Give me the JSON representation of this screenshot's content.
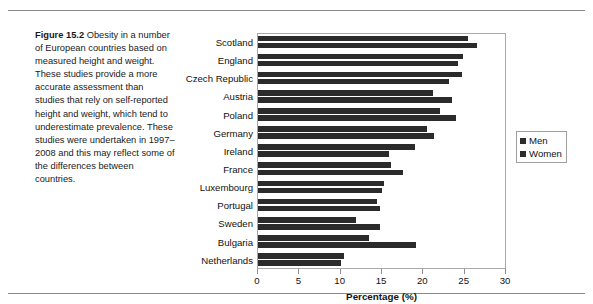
{
  "figure": {
    "label": "Figure 15.2",
    "caption": "Obesity in a number of European countries based on measured height and weight. These studies provide a more accurate assessment than studies that rely on self-reported height and weight, which tend to underestimate prevalence. These studies were undertaken in 1997–2008 and this may reflect some of the differences between countries."
  },
  "legend": {
    "position": "right",
    "items": [
      {
        "label": "Men",
        "color": "#2b2b2b"
      },
      {
        "label": "Women",
        "color": "#2b2b2b"
      }
    ]
  },
  "chart_data": {
    "type": "bar",
    "orientation": "horizontal",
    "title": "",
    "xlabel": "Percentage (%)",
    "ylabel": "",
    "xlim": [
      0,
      30
    ],
    "xticks": [
      0,
      5,
      10,
      15,
      20,
      25,
      30
    ],
    "grid": false,
    "legend_position": "right",
    "categories": [
      "Scotland",
      "England",
      "Czech Republic",
      "Austria",
      "Poland",
      "Germany",
      "Ireland",
      "France",
      "Luxembourg",
      "Portugal",
      "Sweden",
      "Bulgaria",
      "Netherlands"
    ],
    "series": [
      {
        "name": "Men",
        "color": "#2b2b2b",
        "values": [
          25.4,
          24.8,
          24.7,
          21.2,
          22.0,
          20.5,
          19.0,
          16.1,
          15.2,
          14.4,
          11.8,
          13.4,
          10.4
        ]
      },
      {
        "name": "Women",
        "color": "#2b2b2b",
        "values": [
          26.5,
          24.2,
          23.1,
          23.5,
          24.0,
          21.3,
          15.8,
          17.6,
          15.0,
          14.7,
          14.8,
          19.1,
          10.1
        ]
      }
    ]
  }
}
